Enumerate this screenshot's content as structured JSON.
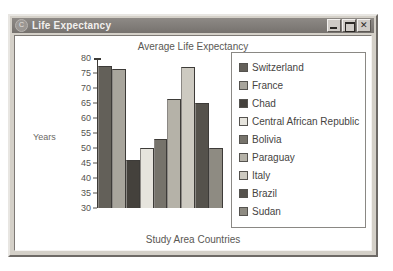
{
  "window": {
    "title": "Life Expectancy",
    "icon": "app-icon",
    "controls": [
      {
        "name": "minimize",
        "glyph": "_"
      },
      {
        "name": "maximize",
        "glyph": "□"
      },
      {
        "name": "close",
        "glyph": "✕"
      }
    ]
  },
  "chart_data": {
    "type": "bar",
    "title": "Average Life Expectancy",
    "xlabel": "Study Area Countries",
    "ylabel": "Years",
    "ylim": [
      30,
      80
    ],
    "yticks": [
      80,
      75,
      70,
      65,
      60,
      55,
      50,
      45,
      40,
      35,
      30
    ],
    "grid": false,
    "legend_position": "right",
    "categories": [
      "Switzerland",
      "France",
      "Chad",
      "Central African Republic",
      "Bolivia",
      "Paraguay",
      "Italy",
      "Brazil",
      "Sudan"
    ],
    "values": [
      77.5,
      76.5,
      46,
      50,
      53,
      66.5,
      77,
      65,
      50
    ],
    "colors": [
      "#636059",
      "#a8a59c",
      "#44413c",
      "#e6e4dd",
      "#76736b",
      "#b5b2a8",
      "#cdcac1",
      "#55524c",
      "#8e8b82"
    ]
  }
}
